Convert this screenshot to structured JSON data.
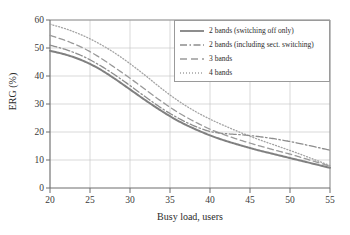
{
  "chart_data": {
    "type": "line",
    "title": "",
    "xlabel": "Busy load, users",
    "ylabel": "ERG (%)",
    "xlim": [
      20,
      55
    ],
    "ylim": [
      0,
      60
    ],
    "xticks": [
      "20",
      "25",
      "30",
      "35",
      "40",
      "45",
      "50",
      "55"
    ],
    "yticks": [
      "0",
      "10",
      "20",
      "30",
      "40",
      "50",
      "60"
    ],
    "grid": true,
    "legend_position": "top-right",
    "x": [
      20,
      22,
      24,
      26,
      28,
      30,
      32,
      34,
      36,
      38,
      40,
      42,
      44,
      46,
      48,
      50,
      52,
      55
    ],
    "series": [
      {
        "name": "2 bands (switching off only)",
        "style": "solid",
        "color": "#808080",
        "values": [
          49.0,
          47.6,
          45.6,
          42.8,
          39.2,
          35.2,
          31.2,
          27.4,
          24.0,
          21.2,
          18.8,
          16.8,
          15.1,
          13.5,
          12.1,
          10.7,
          9.3,
          7.2
        ]
      },
      {
        "name": "2 bands (including sect. switching)",
        "style": "dash-dot",
        "color": "#8d8d8d",
        "values": [
          51.0,
          49.4,
          47.2,
          44.2,
          40.6,
          36.6,
          32.4,
          28.4,
          25.0,
          22.2,
          20.2,
          19.4,
          19.0,
          18.4,
          17.6,
          16.6,
          15.4,
          13.5
        ]
      },
      {
        "name": "3 bands",
        "style": "dashed",
        "color": "#9a9a9a",
        "values": [
          54.5,
          52.6,
          50.2,
          47.0,
          43.2,
          39.2,
          35.0,
          30.8,
          27.0,
          23.8,
          21.0,
          18.8,
          16.9,
          15.2,
          13.6,
          12.1,
          10.4,
          7.8
        ]
      },
      {
        "name": "4 bands",
        "style": "dotted",
        "color": "#a3a3a3",
        "values": [
          58.5,
          56.8,
          54.6,
          51.8,
          48.4,
          44.4,
          40.0,
          35.4,
          31.2,
          27.6,
          24.6,
          22.0,
          19.6,
          17.4,
          15.4,
          13.4,
          11.3,
          8.0
        ]
      }
    ]
  },
  "axes": {
    "ylabel": "ERG (%)",
    "xlabel": "Busy load, users",
    "yticks": [
      "60",
      "50",
      "40",
      "30",
      "20",
      "10",
      "0"
    ],
    "xticks": [
      "20",
      "25",
      "30",
      "35",
      "40",
      "45",
      "50",
      "55"
    ]
  },
  "legend": {
    "items": [
      {
        "label": "2 bands (switching off only)"
      },
      {
        "label": "2 bands (including sect. switching)"
      },
      {
        "label": "3 bands"
      },
      {
        "label": "4 bands"
      }
    ]
  }
}
